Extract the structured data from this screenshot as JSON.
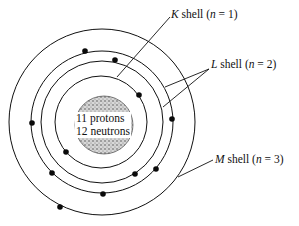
{
  "diagram": {
    "nucleus": {
      "line1": "11 protons",
      "line2": "12 neutrons"
    },
    "labels": {
      "k": {
        "letter": "K",
        "text": " shell (",
        "n": "n",
        "eq": " = 1)"
      },
      "l": {
        "letter": "L",
        "text": " shell (",
        "n": "n",
        "eq": " = 2)"
      },
      "m": {
        "letter": "M",
        "text": " shell (",
        "n": "n",
        "eq": " = 3)"
      }
    },
    "shells": [
      {
        "name": "K",
        "n": 1,
        "radius": 46
      },
      {
        "name": "L-inner",
        "n": 2,
        "radius": 61
      },
      {
        "name": "L-outer",
        "n": 2,
        "radius": 71
      },
      {
        "name": "M",
        "n": 3,
        "radius": 93
      }
    ],
    "electron_count": 11,
    "colors": {
      "stroke": "#111111",
      "electron": "#0a0a0a",
      "nucleus_fill": "#bbbbbb"
    }
  }
}
